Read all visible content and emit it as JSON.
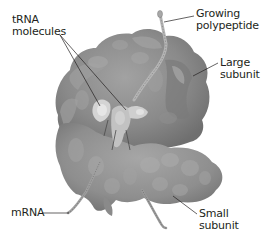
{
  "diagram": {
    "colors": {
      "background": "#ffffff",
      "ribosome_dark": "#7d7d7d",
      "ribosome_mid": "#929292",
      "ribosome_light": "#b4b4b4",
      "trna": "#d6d6d6",
      "leader_line": "#231f20",
      "text": "#231f20"
    },
    "labels": {
      "trna": {
        "line1": "tRNA",
        "line2": "molecules"
      },
      "polypeptide": {
        "line1": "Growing",
        "line2": "polypeptide"
      },
      "large_subunit": {
        "line1": "Large",
        "line2": "subunit"
      },
      "mrna": {
        "line1": "mRNA"
      },
      "small_subunit": {
        "line1": "Small",
        "line2": "subunit"
      }
    }
  }
}
